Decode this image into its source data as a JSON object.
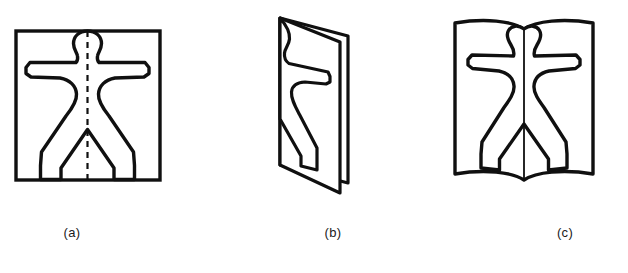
{
  "figure": {
    "background_color": "#ffffff",
    "stroke_color": "#101010",
    "fill_color": "#ffffff",
    "panel_count": 3,
    "panels": [
      {
        "id": "a",
        "caption": "(a)",
        "description": "Square sheet of paper with a symmetric human figure outline and a vertical dashed fold line through the centre",
        "shapes": {
          "frame": "square",
          "cut_outline": "human-figure",
          "fold_line": "vertical-dashed-center"
        }
      },
      {
        "id": "b",
        "caption": "(b)",
        "description": "The sheet folded in half along the dashed line, shown in perspective as a standing folded card with half of the figure cut out on the front panel",
        "shapes": {
          "frame": "folded-card-perspective",
          "cut_outline": "half-human-figure",
          "fold_line": "spine-left"
        }
      },
      {
        "id": "c",
        "caption": "(c)",
        "description": "The folded sheet reopened like a book, showing the complete symmetric human figure across both halves",
        "shapes": {
          "frame": "open-book",
          "cut_outline": "human-figure",
          "fold_line": "vertical-solid-center"
        }
      }
    ]
  }
}
